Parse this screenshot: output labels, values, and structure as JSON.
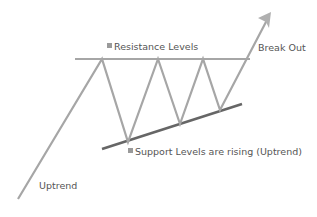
{
  "labels": {
    "resistance": "Resistance Levels",
    "breakout": "Break Out",
    "support": "Support Levels are rising (Uptrend)",
    "uptrend": "Uptrend"
  },
  "colors": {
    "background": "#ffffff",
    "price_line": "#a6a6a6",
    "resistance_line": "#a6a6a6",
    "support_line": "#666666",
    "text": "#555555",
    "bullet": "#9a9a9a"
  },
  "pattern": {
    "type": "ascending-triangle",
    "price_path_sequence": [
      "start-uptrend",
      "resistance-touch-1",
      "support-low-1",
      "resistance-touch-2",
      "support-low-2",
      "resistance-touch-3",
      "support-low-3",
      "breakout"
    ],
    "resistance_touches": 3,
    "support_lows": 3,
    "support_trend": "rising",
    "breakout_direction": "up"
  }
}
